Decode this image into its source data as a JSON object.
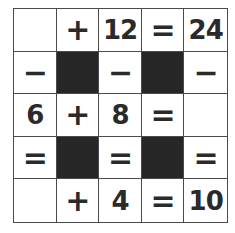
{
  "puzzle": {
    "type": "math-crossword",
    "colors": {
      "grid_line": "#4a4a4a",
      "blocked": "#262626",
      "text": "#2a2a2a",
      "background": "#ffffff"
    },
    "cells": [
      {
        "row": 0,
        "col": 0,
        "kind": "blank",
        "value": ""
      },
      {
        "row": 0,
        "col": 1,
        "kind": "operator",
        "value": "+"
      },
      {
        "row": 0,
        "col": 2,
        "kind": "number",
        "value": "12"
      },
      {
        "row": 0,
        "col": 3,
        "kind": "operator",
        "value": "="
      },
      {
        "row": 0,
        "col": 4,
        "kind": "number",
        "value": "24"
      },
      {
        "row": 1,
        "col": 0,
        "kind": "operator",
        "value": "−"
      },
      {
        "row": 1,
        "col": 1,
        "kind": "blocked",
        "value": ""
      },
      {
        "row": 1,
        "col": 2,
        "kind": "operator",
        "value": "−"
      },
      {
        "row": 1,
        "col": 3,
        "kind": "blocked",
        "value": ""
      },
      {
        "row": 1,
        "col": 4,
        "kind": "operator",
        "value": "−"
      },
      {
        "row": 2,
        "col": 0,
        "kind": "number",
        "value": "6"
      },
      {
        "row": 2,
        "col": 1,
        "kind": "operator",
        "value": "+"
      },
      {
        "row": 2,
        "col": 2,
        "kind": "number",
        "value": "8"
      },
      {
        "row": 2,
        "col": 3,
        "kind": "operator",
        "value": "="
      },
      {
        "row": 2,
        "col": 4,
        "kind": "blank",
        "value": ""
      },
      {
        "row": 3,
        "col": 0,
        "kind": "operator",
        "value": "="
      },
      {
        "row": 3,
        "col": 1,
        "kind": "blocked",
        "value": ""
      },
      {
        "row": 3,
        "col": 2,
        "kind": "operator",
        "value": "="
      },
      {
        "row": 3,
        "col": 3,
        "kind": "blocked",
        "value": ""
      },
      {
        "row": 3,
        "col": 4,
        "kind": "operator",
        "value": "="
      },
      {
        "row": 4,
        "col": 0,
        "kind": "blank",
        "value": ""
      },
      {
        "row": 4,
        "col": 1,
        "kind": "operator",
        "value": "+"
      },
      {
        "row": 4,
        "col": 2,
        "kind": "number",
        "value": "4"
      },
      {
        "row": 4,
        "col": 3,
        "kind": "operator",
        "value": "="
      },
      {
        "row": 4,
        "col": 4,
        "kind": "number",
        "value": "10"
      }
    ]
  }
}
